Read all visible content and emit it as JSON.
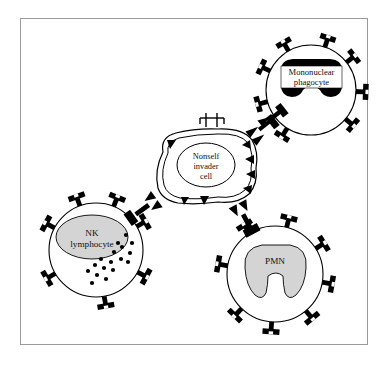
{
  "figure": {
    "frame": {
      "border_color": "#9a9a9a",
      "background_color": "#ffffff",
      "x": 20,
      "y": 18,
      "width": 348,
      "height": 327
    },
    "ink_color": "#000000",
    "nucleus_gray": "#d4d4d4",
    "nucleus_black": "#000000"
  },
  "cells": [
    {
      "id": "mononuclear-phagocyte",
      "label_lines": [
        "Mononuclear",
        "phagocyte"
      ],
      "label_full": "Mononuclear phagocyte",
      "shape": "circle",
      "cx": 311,
      "cy": 90,
      "r": 45,
      "nucleus_style": "kidney-black",
      "nucleus_color": "#000000",
      "label_box": true,
      "receptor_count": 8,
      "granule_count": 0
    },
    {
      "id": "nk-lymphocyte",
      "label_lines": [
        "NK",
        "lymphocyte"
      ],
      "label_full": "NK lymphocyte",
      "shape": "circle",
      "cx": 96,
      "cy": 250,
      "r": 47,
      "nucleus_style": "oval-gray",
      "nucleus_color": "#d4d4d4",
      "label_box": false,
      "receptor_count": 7,
      "granule_count": 17
    },
    {
      "id": "pmn",
      "label_lines": [
        "PMN"
      ],
      "label_full": "PMN",
      "shape": "circle",
      "cx": 275,
      "cy": 274,
      "r": 48,
      "nucleus_style": "trilobed-gray",
      "nucleus_color": "#d4d4d4",
      "label_box": false,
      "receptor_count": 8,
      "granule_count": 0
    },
    {
      "id": "nonself-invader-cell",
      "label_lines": [
        "Nonself",
        "invader",
        "cell"
      ],
      "label_full": "Nonself invader cell",
      "shape": "irregular-blob",
      "cx": 206,
      "cy": 165,
      "nucleus_style": "oval-outline",
      "nucleus_color": "#ffffff",
      "label_box": false,
      "antigen_count": 7,
      "surface_marker_count": 2
    }
  ],
  "junctions": [
    {
      "id": "phagocyte-invader-junction",
      "from": "mononuclear-phagocyte",
      "to": "nonself-invader-cell"
    },
    {
      "id": "nk-invader-junction",
      "from": "nk-lymphocyte",
      "to": "nonself-invader-cell"
    },
    {
      "id": "pmn-invader-junction",
      "from": "pmn",
      "to": "nonself-invader-cell"
    }
  ]
}
